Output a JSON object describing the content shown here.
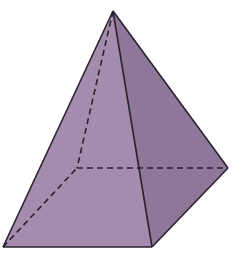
{
  "diagram": {
    "type": "square-pyramid",
    "vertices": {
      "apex": [
        113,
        11
      ],
      "base_front_left": [
        3,
        247
      ],
      "base_front_right": [
        152,
        247
      ],
      "base_back_right": [
        228,
        168
      ],
      "base_back_left_hidden": [
        77,
        168
      ]
    },
    "colors": {
      "front_face": "#a58bae",
      "right_face": "#8f7799",
      "edge": "#2a2230",
      "background": "#ffffff"
    },
    "edges": {
      "visible": [
        [
          "apex",
          "base_front_left"
        ],
        [
          "apex",
          "base_front_right"
        ],
        [
          "apex",
          "base_back_right"
        ],
        [
          "base_front_left",
          "base_front_right"
        ],
        [
          "base_front_right",
          "base_back_right"
        ]
      ],
      "hidden": [
        [
          "apex",
          "base_back_left_hidden"
        ],
        [
          "base_front_left",
          "base_back_left_hidden"
        ],
        [
          "base_back_left_hidden",
          "base_back_right"
        ]
      ]
    }
  }
}
